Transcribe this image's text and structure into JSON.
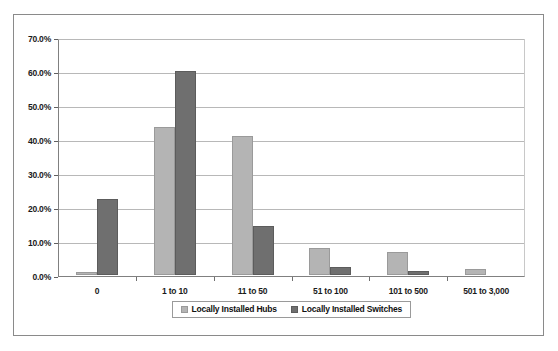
{
  "chart_data": {
    "type": "bar",
    "title": "",
    "subtitle": "",
    "xlabel": "",
    "ylabel": "",
    "categories": [
      "0",
      "1 to 10",
      "11 to 50",
      "51 to 100",
      "101 to 500",
      "501 to 3,000"
    ],
    "series": [
      {
        "name": "Locally Installed Hubs",
        "color": "#b4b4b4",
        "values": [
          1.0,
          43.5,
          41.0,
          8.0,
          6.8,
          1.7
        ]
      },
      {
        "name": "Locally Installed Switches",
        "color": "#6f6f6f",
        "values": [
          22.4,
          60.0,
          14.5,
          2.5,
          1.3,
          0.0
        ]
      }
    ],
    "ylim": [
      0,
      70
    ],
    "ytick_values": [
      0,
      10,
      20,
      30,
      40,
      50,
      60,
      70
    ],
    "ytick_labels": [
      "0.0%",
      "10.0%",
      "20.0%",
      "30.0%",
      "40.0%",
      "50.0%",
      "60.0%",
      "70.0%"
    ],
    "grid": true,
    "grid_axis": "y",
    "legend_position": "bottom",
    "legend": [
      "Locally Installed Hubs",
      "Locally Installed Switches"
    ]
  }
}
